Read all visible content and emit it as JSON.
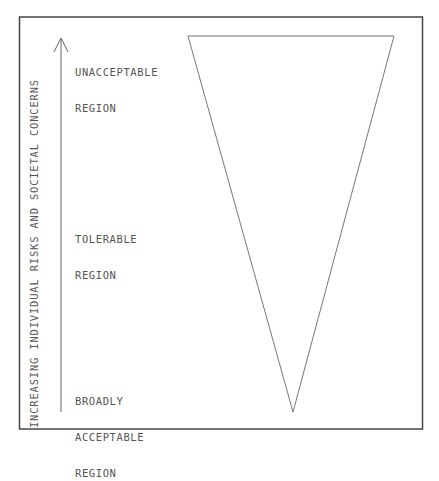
{
  "diagram": {
    "axis_label": "INCREASING INDIVIDUAL RISKS AND SOCIETAL CONCERNS",
    "regions": [
      {
        "line1": "UNACCEPTABLE",
        "line2": "REGION",
        "line3": ""
      },
      {
        "line1": "TOLERABLE",
        "line2": "REGION",
        "line3": ""
      },
      {
        "line1": "BROADLY",
        "line2": "ACCEPTABLE",
        "line3": "REGION"
      }
    ],
    "colors": {
      "line": "#666666",
      "border": "#444444",
      "text": "#555555"
    }
  }
}
